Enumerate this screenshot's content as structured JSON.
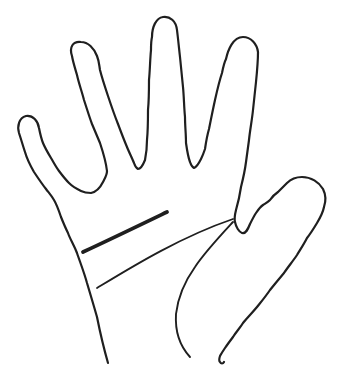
{
  "illustration": {
    "title": "Open hand with palm lines",
    "subject": "Hand-drawn black outline of an open palm facing the viewer: four fingers spread at the top (pinky leaning left, ring, middle tallest, index), thumb pointing to the upper right, wrist open at the bottom edge, with three palmistry creases on the palm",
    "style": "black ink line drawing on white background",
    "background_color": "#ffffff",
    "stroke_color": "#1f1f1f",
    "canvas": {
      "width": 338,
      "height": 380,
      "viewBox": "0 0 338 380"
    },
    "paths": {
      "hand_outline": {
        "label": "hand outline: five spread digits, open at wrist",
        "stroke_width": 2.2,
        "d": "M 108,363 C 104,349 100,332 97,317 C 93,303 90,293 87,283 C 84,272 80,262 77,253 C 74,245 70,239 68,233 C 65,227 63,222 61,217 C 59,211 57,205 54,200 C 51,195 49,193 46,189 C 42,184 38,178 34,172 C 30,165 27,159 25,152 C 23,146 21,139 19,133 C 17,126 19,118 26,116 C 33,115 38,121 39,128 C 40,133 41,138 43,143 C 45,148 48,153 51,158 C 54,163 56,167 59,171 C 62,175 65,179 69,183 C 73,187 77,189 81,191 C 85,193 88,193 91,193 C 96,192 100,188 103,182 C 105,178 107,175 107,171 C 106,162 103,152 100,143 C 97,136 95,131 92,124 C 89,116 87,109 84,100 C 82,92 79,84 77,75 C 75,68 73,62 72,56 C 69,47 73,41 81,42 C 88,42 94,48 97,56 C 99,61 99,64 100,70 C 102,78 105,87 108,96 C 111,105 114,114 118,124 C 121,132 124,140 127,147 C 129,152 132,158 134,163 C 135,166 136,168 138,169 C 141,169 143,165 145,160 C 146,155 147,148 147,140 C 148,130 148,120 148,110 C 149,100 149,90 149,80 C 150,70 150,60 151,50 C 151,45 151,41 152,37 C 152,27 156,18 163,17 C 170,16 176,21 177,30 C 178,38 179,48 180,57 C 181,67 182,77 183,87 C 184,97 184,107 185,117 C 185,126 186,134 186,143 C 187,150 188,157 190,162 C 191,165 192,167 194,168 C 197,167 199,163 201,159 C 203,155 204,152 205,149 C 206,142 207,136 209,129 C 211,119 213,109 215,100 C 217,91 219,82 222,73 C 223,68 224,63 226,59 C 228,50 233,37 243,37 C 251,37 257,44 258,52 C 258,62 257,72 256,82 C 255,91 254,101 253,110 C 252,120 250,130 249,140 C 248,147 247,155 246,162 C 245,170 243,179 241,187 C 240,194 238,203 236,210 C 235,214 234,218 235,222 C 236,227 239,232 242,233 C 246,234 248,229 250,224 C 252,220 254,216 256,213 C 258,210 260,207 263,205 C 266,203 268,202 270,200 C 272,197 275,194 278,192 C 281,189 284,186 287,183 C 291,179 296,177 302,177 C 311,177 319,182 323,189 C 326,195 326,201 324,207 C 323,212 320,218 317,223 C 314,228 311,233 307,238 C 304,244 300,250 297,255 C 293,261 288,267 284,273 C 279,279 274,285 270,290 C 266,296 261,302 257,307 C 252,313 247,318 243,323 C 240,328 236,332 233,337 C 230,341 227,345 225,348 C 223,351 221,354 220,356 C 219,359 219,361 220,362 C 221,364 223,364 224,362"
      },
      "heart_line": {
        "label": "heart line: short thick nearly straight crease across upper palm",
        "stroke_width": 3.8,
        "d": "M 83,252 C 111,239 140,225 167,212"
      },
      "head_line": {
        "label": "head line: long thin crease from lower left palm to base of index finger",
        "stroke_width": 1.8,
        "d": "M 97,288 C 130,268 180,237 233,219"
      },
      "life_line": {
        "label": "life line: crease curving around the ball of the thumb toward the wrist",
        "stroke_width": 1.9,
        "d": "M 233,222 C 221,235 205,252 195,267 C 185,281 178,297 176,314 C 175,330 179,345 190,357"
      }
    }
  }
}
